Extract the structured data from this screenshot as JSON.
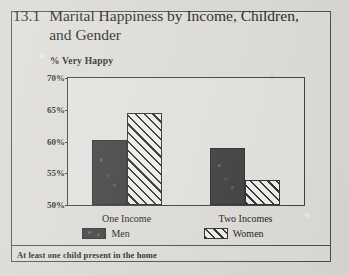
{
  "figure": {
    "number": "13.1",
    "title": "Marital Happiness by Income, Children, and Gender",
    "footnote": "At least one child present in the home"
  },
  "chart_data": {
    "type": "bar",
    "title": "Marital Happiness by Income, Children, and Gender",
    "subtitle": "",
    "ylabel": "% Very Happy",
    "xlabel": "",
    "categories": [
      "One Income",
      "Two Incomes"
    ],
    "series": [
      {
        "name": "Men",
        "values": [
          60.3,
          59.0
        ],
        "fill": "solid",
        "color": "#3a3a3a"
      },
      {
        "name": "Women",
        "values": [
          64.5,
          54.0
        ],
        "fill": "hatch",
        "color": "#2b2b2b"
      }
    ],
    "ylim": [
      50,
      70
    ],
    "yticks": [
      "50%",
      "55%",
      "60%",
      "65%",
      "70%"
    ],
    "ytick_values": [
      50,
      55,
      60,
      65,
      70
    ],
    "grid": false,
    "legend_position": "bottom",
    "note": "At least one child present in the home"
  }
}
